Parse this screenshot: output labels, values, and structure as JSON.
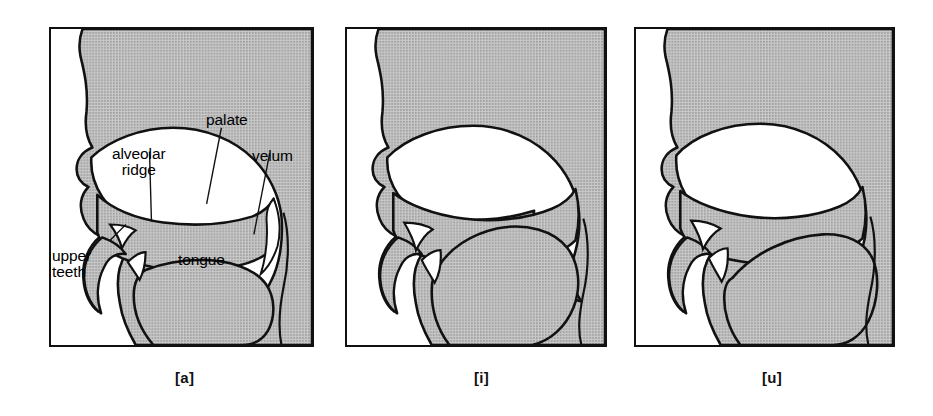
{
  "figure": {
    "type": "vocal-tract-sagittal-diagrams",
    "panel_count": 3,
    "colors": {
      "background": "#ffffff",
      "tissue_fill": "#b9b9b9",
      "air_cavity_fill": "#ffffff",
      "outline": "#111111",
      "text": "#000000"
    }
  },
  "panels": [
    {
      "id": "panel-a",
      "caption": "[a]",
      "vowel": "a",
      "description": "Sagittal section of the vocal tract for the vowel [a]; tongue low and back, velum raised.",
      "labels": [
        {
          "name": "palate",
          "text": "palate"
        },
        {
          "name": "alveolar-ridge",
          "text": "alveolar\nridge"
        },
        {
          "name": "velum",
          "text": "velum"
        },
        {
          "name": "upper-teeth",
          "text": "upper\nteeth"
        },
        {
          "name": "tongue",
          "text": "tongue"
        }
      ]
    },
    {
      "id": "panel-i",
      "caption": "[i]",
      "vowel": "i",
      "description": "Sagittal section of the vocal tract for the vowel [i]; tongue high and front.",
      "labels": []
    },
    {
      "id": "panel-u",
      "caption": "[u]",
      "vowel": "u",
      "description": "Sagittal section of the vocal tract for the vowel [u]; tongue high and back.",
      "labels": []
    }
  ],
  "captions": {
    "a": "[a]",
    "i": "[i]",
    "u": "[u]"
  },
  "labels": {
    "palate": "palate",
    "alveolar_ridge_line1": "alveolar",
    "alveolar_ridge_line2": "ridge",
    "velum": "velum",
    "upper_teeth_line1": "upper",
    "upper_teeth_line2": "teeth",
    "tongue": "tongue"
  }
}
